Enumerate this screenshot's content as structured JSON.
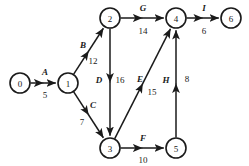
{
  "diagram": {
    "type": "activity-on-arc-network",
    "background_color": "#ffffff",
    "stroke_color": "#1a1a1a",
    "width": 249,
    "height": 166
  },
  "nodes": [
    {
      "id": "0",
      "label": "0",
      "cx": 20,
      "cy": 83,
      "r": 10
    },
    {
      "id": "1",
      "label": "1",
      "cx": 68,
      "cy": 83,
      "r": 10
    },
    {
      "id": "2",
      "label": "2",
      "cx": 110,
      "cy": 18,
      "r": 10
    },
    {
      "id": "3",
      "label": "3",
      "cx": 110,
      "cy": 148,
      "r": 10
    },
    {
      "id": "4",
      "label": "4",
      "cx": 176,
      "cy": 18,
      "r": 10
    },
    {
      "id": "5",
      "label": "5",
      "cx": 176,
      "cy": 148,
      "r": 10
    },
    {
      "id": "6",
      "label": "6",
      "cx": 231,
      "cy": 18,
      "r": 10
    }
  ],
  "edges": [
    {
      "id": "A",
      "name": "A",
      "weight": "5",
      "from": "0",
      "to": "1",
      "name_x": 45,
      "name_y": 72,
      "weight_x": 45,
      "weight_y": 95
    },
    {
      "id": "B",
      "name": "B",
      "weight": "12",
      "from": "1",
      "to": "2",
      "name_x": 83,
      "name_y": 45,
      "weight_x": 93,
      "weight_y": 61
    },
    {
      "id": "C",
      "name": "C",
      "weight": "7",
      "from": "1",
      "to": "3",
      "name_x": 93,
      "name_y": 105,
      "weight_x": 82,
      "weight_y": 122
    },
    {
      "id": "D",
      "name": "D",
      "weight": "16",
      "from": "2",
      "to": "3",
      "name_x": 99,
      "name_y": 80,
      "weight_x": 120,
      "weight_y": 80
    },
    {
      "id": "E",
      "name": "E",
      "weight": "15",
      "from": "3",
      "to": "4",
      "name_x": 140,
      "name_y": 79,
      "weight_x": 152,
      "weight_y": 92
    },
    {
      "id": "F",
      "name": "F",
      "weight": "10",
      "from": "3",
      "to": "5",
      "name_x": 143,
      "name_y": 138,
      "weight_x": 143,
      "weight_y": 160
    },
    {
      "id": "G",
      "name": "G",
      "weight": "14",
      "from": "2",
      "to": "4",
      "name_x": 143,
      "name_y": 8,
      "weight_x": 143,
      "weight_y": 31
    },
    {
      "id": "H",
      "name": "H",
      "weight": "8",
      "from": "5",
      "to": "4",
      "name_x": 166,
      "name_y": 80,
      "weight_x": 187,
      "weight_y": 79
    },
    {
      "id": "I",
      "name": "I",
      "weight": "6",
      "from": "4",
      "to": "6",
      "name_x": 204,
      "name_y": 8,
      "weight_x": 204,
      "weight_y": 31
    }
  ]
}
